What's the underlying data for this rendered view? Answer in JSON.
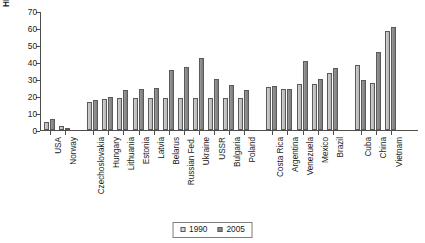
{
  "chart_data": {
    "type": "bar",
    "title": "",
    "subtitle": "",
    "xlabel": "",
    "ylabel": "HDI adjusted ratio",
    "ylim": [
      0,
      70
    ],
    "yticks": [
      0,
      10,
      20,
      30,
      40,
      50,
      60,
      70
    ],
    "grid": false,
    "legend_position": "bottom-center",
    "categories": [
      "USA",
      "Norway",
      "Czechoslovakia",
      "Hungary",
      "Lithuania",
      "Estonia",
      "Latvia",
      "Belarus",
      "Russian Fed.",
      "Ukraine",
      "USSR",
      "Bulgaria",
      "Poland",
      "Costa Rica",
      "Argentina",
      "Venezuela",
      "Mexico",
      "Brazil",
      "Cuba",
      "China",
      "Vietnam"
    ],
    "groups": [
      {
        "name": "group-1",
        "categories": [
          "USA",
          "Norway"
        ]
      },
      {
        "name": "group-2",
        "categories": [
          "Czechoslovakia",
          "Hungary",
          "Lithuania",
          "Estonia",
          "Latvia",
          "Belarus",
          "Russian Fed.",
          "Ukraine",
          "USSR",
          "Bulgaria",
          "Poland"
        ]
      },
      {
        "name": "group-3",
        "categories": [
          "Costa Rica",
          "Argentina",
          "Venezuela",
          "Mexico",
          "Brazil"
        ]
      },
      {
        "name": "group-4",
        "categories": [
          "Cuba",
          "China",
          "Vietnam"
        ]
      }
    ],
    "series": [
      {
        "name": "1990",
        "color": "#c8c8c8",
        "values": [
          4.5,
          2.5,
          16.5,
          18.5,
          19.2,
          19.2,
          19.2,
          19.2,
          19.2,
          19.2,
          19.2,
          19.2,
          19.2,
          25.5,
          24.5,
          27.5,
          27.5,
          34.0,
          38.5,
          28.0,
          58.5
        ]
      },
      {
        "name": "2005",
        "color": "#8b8b8b",
        "values": [
          6.8,
          1.0,
          18.0,
          19.8,
          23.5,
          24.2,
          24.8,
          35.5,
          37.5,
          42.5,
          30.5,
          27.0,
          24.0,
          26.0,
          24.5,
          41.0,
          30.5,
          36.5,
          29.5,
          46.0,
          61.0
        ]
      }
    ]
  },
  "legend": {
    "items": [
      {
        "label": "1990",
        "swatch": "light-gray-square"
      },
      {
        "label": "2005",
        "swatch": "dark-gray-square"
      }
    ]
  }
}
